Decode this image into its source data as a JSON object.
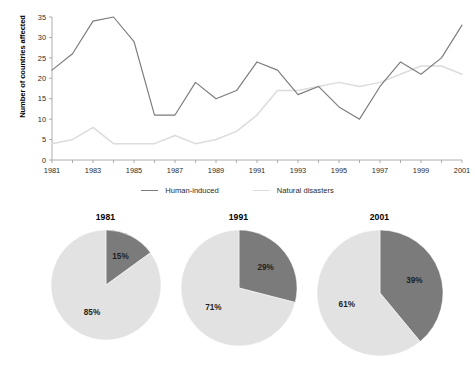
{
  "chart_data": [
    {
      "type": "line",
      "title": "",
      "xlabel": "",
      "ylabel": "Number of countries affected",
      "x": [
        1981,
        1982,
        1983,
        1984,
        1985,
        1986,
        1987,
        1988,
        1989,
        1990,
        1991,
        1992,
        1993,
        1994,
        1995,
        1996,
        1997,
        1998,
        1999,
        2000,
        2001
      ],
      "xlim": [
        1981,
        2001
      ],
      "ylim": [
        0,
        35
      ],
      "yticks": [
        0,
        5,
        10,
        15,
        20,
        25,
        30,
        35
      ],
      "xticks": [
        1981,
        1983,
        1985,
        1987,
        1989,
        1991,
        1993,
        1995,
        1997,
        1999,
        2001
      ],
      "xtick_labels": [
        "1981",
        "1983",
        "1985",
        "1987",
        "1989",
        "1991",
        "1993",
        "1995",
        "1997",
        "1999",
        "2001"
      ],
      "ytick_labels": [
        "0",
        "5",
        "10",
        "15",
        "20",
        "25",
        "30",
        "35"
      ],
      "grid": false,
      "legend_position": "bottom",
      "series": [
        {
          "name": "Human-induced",
          "color": "#7b7b7b",
          "values": [
            22,
            26,
            34,
            35,
            29,
            11,
            11,
            19,
            15,
            17,
            24,
            22,
            16,
            18,
            13,
            10,
            18,
            24,
            21,
            25,
            33
          ]
        },
        {
          "name": "Natural disasters",
          "color": "#dcdcdc",
          "values": [
            4,
            5,
            8,
            4,
            4,
            4,
            6,
            4,
            5,
            7,
            11,
            17,
            17,
            18,
            19,
            18,
            19,
            21,
            23,
            23,
            21
          ]
        }
      ]
    },
    {
      "type": "pie",
      "title": "1981",
      "labels": [
        "Human-induced",
        "Natural disasters"
      ],
      "values": [
        15,
        85
      ],
      "value_labels": [
        "15%",
        "85%"
      ],
      "colors": [
        "#7b7b7b",
        "#e2e2e2"
      ]
    },
    {
      "type": "pie",
      "title": "1991",
      "labels": [
        "Human-induced",
        "Natural disasters"
      ],
      "values": [
        29,
        71
      ],
      "value_labels": [
        "29%",
        "71%"
      ],
      "colors": [
        "#7b7b7b",
        "#e2e2e2"
      ]
    },
    {
      "type": "pie",
      "title": "2001",
      "labels": [
        "Human-induced",
        "Natural disasters"
      ],
      "values": [
        39,
        61
      ],
      "value_labels": [
        "39%",
        "61%"
      ],
      "colors": [
        "#7b7b7b",
        "#e2e2e2"
      ]
    }
  ],
  "line_chart": {
    "y_axis_title": "Number of countries affected"
  },
  "legend": {
    "items": [
      {
        "label": "Human-induced",
        "color": "#7b7b7b"
      },
      {
        "label": "Natural disasters",
        "color": "#dcdcdc"
      }
    ]
  },
  "pies": [
    {
      "title": "1981",
      "dark_label": "15%",
      "light_label": "85%"
    },
    {
      "title": "1991",
      "dark_label": "29%",
      "light_label": "71%"
    },
    {
      "title": "2001",
      "dark_label": "39%",
      "light_label": "61%"
    }
  ]
}
